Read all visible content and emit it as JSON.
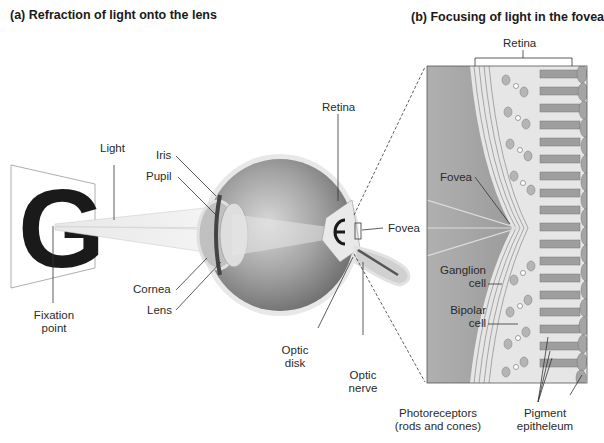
{
  "panels": {
    "a": {
      "title": "(a) Refraction of light onto the lens"
    },
    "b": {
      "title": "(b) Focusing of light in the fovea"
    }
  },
  "labels_a": {
    "light": "Light",
    "iris": "Iris",
    "pupil": "Pupil",
    "retina": "Retina",
    "fovea": "Fovea",
    "cornea": "Cornea",
    "lens": "Lens",
    "fixation_line1": "Fixation",
    "fixation_line2": "point",
    "optic_disk_line1": "Optic",
    "optic_disk_line2": "disk",
    "optic_nerve_line1": "Optic",
    "optic_nerve_line2": "nerve",
    "target_letter": "G"
  },
  "labels_b": {
    "retina": "Retina",
    "fovea": "Fovea",
    "ganglion_line1": "Ganglion",
    "ganglion_line2": "cell",
    "bipolar_line1": "Bipolar",
    "bipolar_line2": "cell",
    "photoreceptors_line1": "Photoreceptors",
    "photoreceptors_line2": "(rods and cones)",
    "pigment_line1": "Pigment",
    "pigment_line2": "epitheleum"
  },
  "colors": {
    "ink": "#1a1a1a",
    "eye_dark": "#7d7d7d",
    "eye_light": "#c9c9c9",
    "retina_bg": "#9a9a9a",
    "cell_fill": "#b5b5b5",
    "light_beam": "#e6e6e6"
  }
}
